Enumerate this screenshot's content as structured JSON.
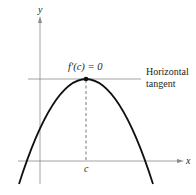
{
  "diagram": {
    "axis_labels": {
      "x": "x",
      "y": "y"
    },
    "tick_label": "c",
    "annotation": "f′(c) = 0",
    "tangent_label_line1": "Horizontal",
    "tangent_label_line2": "tangent",
    "colors": {
      "curve": "#111111",
      "axis": "#8a8a8a",
      "tangent": "#8a8a8a",
      "text": "#231f20"
    }
  }
}
